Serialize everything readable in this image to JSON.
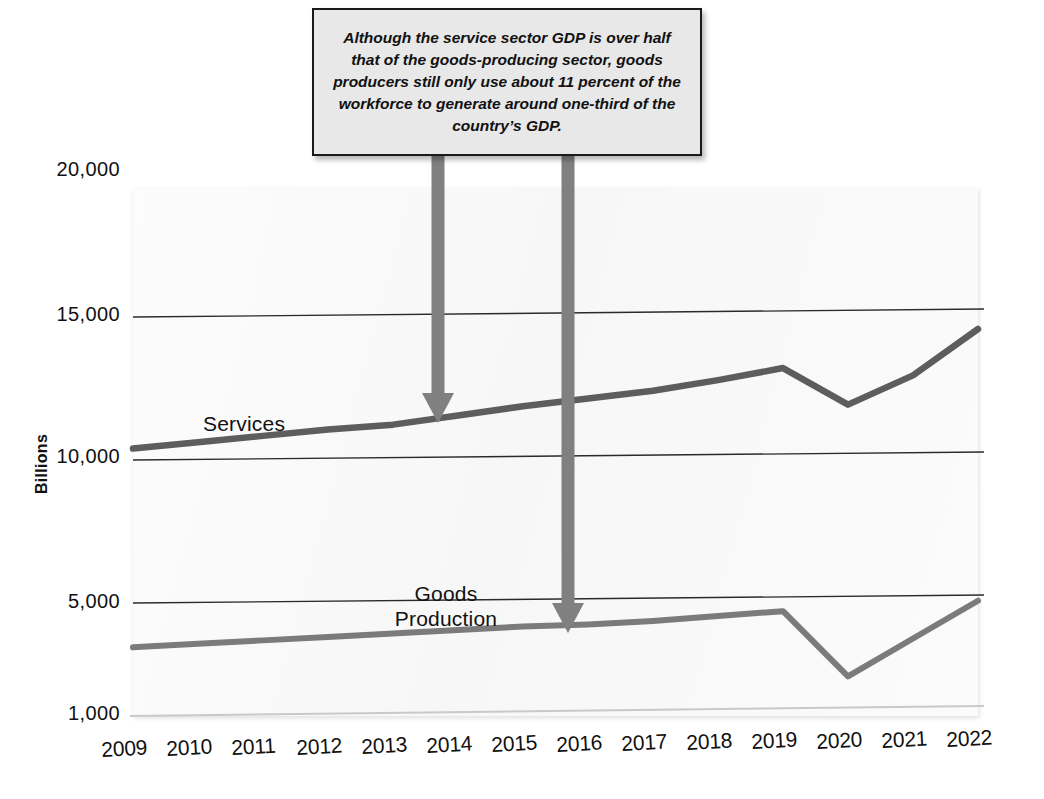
{
  "callout": {
    "text": "Although the service sector GDP is over half that of the goods-producing sector, goods producers still only use about 11 percent of the workforce to generate around one-third of the country’s GDP."
  },
  "labels": {
    "services": "Services",
    "goods_line1": "Goods",
    "goods_line2": "Production"
  },
  "colors": {
    "services_line": "#5d5d5d",
    "goods_line": "#7b7b7b",
    "arrow": "#808080",
    "gridline": "#2a2a2a",
    "callout_fill": "#e8e8e8",
    "callout_border": "#1a1a1a",
    "text": "#111111"
  },
  "chart_data": {
    "type": "line",
    "title": "",
    "xlabel": "",
    "ylabel": "Billions",
    "x": [
      2009,
      2010,
      2011,
      2012,
      2013,
      2014,
      2015,
      2016,
      2017,
      2018,
      2019,
      2020,
      2021,
      2022
    ],
    "categories": [
      "2009",
      "2010",
      "2011",
      "2012",
      "2013",
      "2014",
      "2015",
      "2016",
      "2017",
      "2018",
      "2019",
      "2020",
      "2021",
      "2022"
    ],
    "ylim": [
      1000,
      20000
    ],
    "yticks": [
      1000,
      5000,
      10000,
      15000,
      20000
    ],
    "yticklabels": [
      "1,000",
      "5,000",
      "10,000",
      "15,000",
      "20,000"
    ],
    "grid": true,
    "gridlines_at": [
      5000,
      10000,
      15000
    ],
    "legend": "inline-labels",
    "series": [
      {
        "name": "Services",
        "color": "#5d5d5d",
        "values": [
          10400,
          10600,
          10800,
          11000,
          11150,
          11450,
          11750,
          12000,
          12250,
          12600,
          13000,
          11700,
          12700,
          14300
        ]
      },
      {
        "name": "Goods Production",
        "color": "#7b7b7b",
        "values": [
          3450,
          3550,
          3650,
          3750,
          3850,
          3950,
          4050,
          4100,
          4200,
          4350,
          4500,
          2200,
          3500,
          4800
        ]
      }
    ],
    "annotations": [
      {
        "name": "arrow-to-services",
        "target_series": "Services",
        "target_x": 2013.7,
        "target_y": 11350
      },
      {
        "name": "arrow-to-goods",
        "target_series": "Goods Production",
        "target_x": 2015.7,
        "target_y": 4150
      }
    ]
  }
}
